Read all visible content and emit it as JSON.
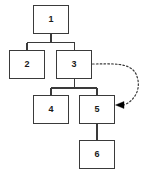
{
  "diagram": {
    "type": "tree-diagram",
    "canvas": {
      "width": 153,
      "height": 173,
      "background": "#ffffff"
    },
    "style": {
      "node_border_color": "#3a3a3a",
      "node_fill_color": "#ffffff",
      "node_text_color": "#1a1a1a",
      "edge_color": "#3a3a3a",
      "dashed_edge_color": "#3a3a3a",
      "arrowhead_color": "#000000"
    },
    "nodes": [
      {
        "id": "node-1",
        "label": "1",
        "x": 33,
        "y": 5,
        "width": 36,
        "height": 29
      },
      {
        "id": "node-2",
        "label": "2",
        "x": 9,
        "y": 50,
        "width": 36,
        "height": 29
      },
      {
        "id": "node-3",
        "label": "3",
        "x": 56,
        "y": 50,
        "width": 36,
        "height": 29
      },
      {
        "id": "node-4",
        "label": "4",
        "x": 33,
        "y": 95,
        "width": 36,
        "height": 29
      },
      {
        "id": "node-5",
        "label": "5",
        "x": 79,
        "y": 95,
        "width": 36,
        "height": 29
      },
      {
        "id": "node-6",
        "label": "6",
        "x": 79,
        "y": 140,
        "width": 36,
        "height": 29
      }
    ],
    "edges": [
      {
        "id": "edge-1-2",
        "from": "node-1",
        "to": "node-2",
        "style": "solid",
        "kind": "orthogonal"
      },
      {
        "id": "edge-1-3",
        "from": "node-1",
        "to": "node-3",
        "style": "solid",
        "kind": "orthogonal"
      },
      {
        "id": "edge-3-4",
        "from": "node-3",
        "to": "node-4",
        "style": "solid",
        "kind": "orthogonal"
      },
      {
        "id": "edge-3-5",
        "from": "node-3",
        "to": "node-5",
        "style": "solid",
        "kind": "orthogonal"
      },
      {
        "id": "edge-5-6",
        "from": "node-5",
        "to": "node-6",
        "style": "solid",
        "kind": "straight"
      },
      {
        "id": "edge-3-5-dashed",
        "from": "node-3",
        "to": "node-5",
        "style": "dashed",
        "kind": "curved",
        "arrowhead": "filled-triangle",
        "direction": "right-loop-back"
      }
    ]
  }
}
